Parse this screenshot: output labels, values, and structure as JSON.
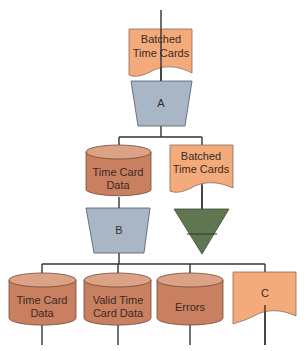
{
  "diagram": {
    "type": "system flowchart",
    "nodes": [
      {
        "id": "doc_top",
        "shape": "document",
        "label_line1": "Batched",
        "label_line2": "Time Cards"
      },
      {
        "id": "proc_a",
        "shape": "manual-operation",
        "label": "A"
      },
      {
        "id": "db_mid",
        "shape": "disk-storage",
        "label_line1": "Time Card",
        "label_line2": "Data"
      },
      {
        "id": "doc_mid",
        "shape": "document",
        "label_line1": "Batched",
        "label_line2": "Time Cards"
      },
      {
        "id": "proc_b",
        "shape": "manual-operation",
        "label": "B"
      },
      {
        "id": "offline",
        "shape": "offline-storage",
        "label": ""
      },
      {
        "id": "db_1",
        "shape": "disk-storage",
        "label_line1": "Time Card",
        "label_line2": "Data"
      },
      {
        "id": "db_2",
        "shape": "disk-storage",
        "label_line1": "Valid Time",
        "label_line2": "Card Data"
      },
      {
        "id": "db_3",
        "shape": "disk-storage",
        "label": "Errors"
      },
      {
        "id": "doc_c",
        "shape": "document",
        "label": "C"
      }
    ],
    "colors": {
      "document": "#f4ab7c",
      "disk": "#c98060",
      "disk_top": "#dba286",
      "process": "#a8b6c6",
      "offline": "#5f7751",
      "line": "#333333"
    }
  }
}
